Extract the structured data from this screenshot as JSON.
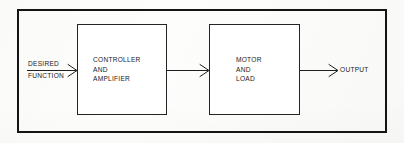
{
  "diagram": {
    "background_color": "#fdfdfc",
    "line_color": "#1a1a1a",
    "text_color": "#1a1a1a",
    "outer_frame": {
      "x": 17,
      "y": 9,
      "width": 370,
      "height": 124
    },
    "blocks": [
      {
        "id": "controller-amplifier",
        "lines": [
          "CONTROLLER",
          "AND",
          "AMPLIFIER"
        ],
        "text": "CONTROLLER\nAND\nAMPLIFIER",
        "x": 77,
        "y": 24,
        "width": 90,
        "height": 91
      },
      {
        "id": "motor-load",
        "lines": [
          "MOTOR",
          "AND",
          "LOAD"
        ],
        "text": "MOTOR\nAND\nLOAD",
        "x": 209,
        "y": 24,
        "width": 91,
        "height": 91
      }
    ],
    "signals": [
      {
        "id": "input-signal",
        "label_top": "DESIRED",
        "label_bottom": "FUNCTION",
        "from_x": 27,
        "to_x": 77,
        "y": 71
      },
      {
        "id": "intermediate-signal",
        "label": "",
        "from_x": 167,
        "to_x": 209,
        "y": 70
      },
      {
        "id": "output-signal",
        "label": "OUTPUT",
        "from_x": 300,
        "to_x": 338,
        "y": 70
      }
    ]
  }
}
